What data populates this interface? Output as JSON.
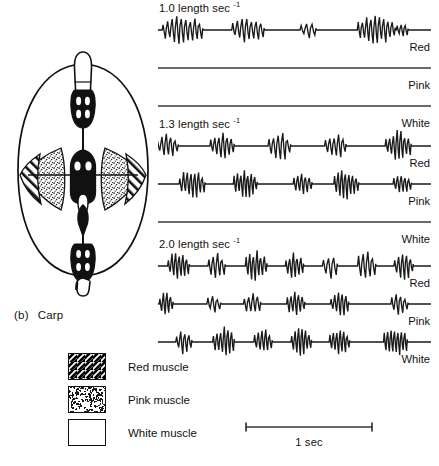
{
  "figure": {
    "panel_letter": "(b)",
    "species": "Carp"
  },
  "legend": {
    "items": [
      {
        "label": "Red muscle",
        "fill": "hatch"
      },
      {
        "label": "Pink muscle",
        "fill": "stipple"
      },
      {
        "label": "White muscle",
        "fill": "white"
      }
    ]
  },
  "scale": {
    "label": "1 sec"
  },
  "colors": {
    "ink": "#111111",
    "trace": "#1a1a1a",
    "background": "#ffffff"
  },
  "chart_data": {
    "type": "line",
    "xlabel": "time",
    "ylabel": "EMG amplitude",
    "x_scale_bar": "1 sec",
    "grid": false,
    "legend_position": "below-left",
    "channels": [
      "Red",
      "Pink",
      "White"
    ],
    "panels": [
      {
        "speed": "1.0",
        "speed_label": "1.0 length sec",
        "speed_exponent": "-1",
        "units": "length sec^-1",
        "traces": [
          {
            "channel": "Red",
            "active": true,
            "burst_count": 4,
            "bursts": [
              {
                "center": 0.09,
                "width": 0.075,
                "amplitude": 1.0,
                "spikes": 9
              },
              {
                "center": 0.33,
                "width": 0.06,
                "amplitude": 0.9,
                "spikes": 7
              },
              {
                "center": 0.55,
                "width": 0.03,
                "amplitude": 0.55,
                "spikes": 3
              },
              {
                "center": 0.8,
                "width": 0.07,
                "amplitude": 0.95,
                "spikes": 9
              },
              {
                "center": 0.895,
                "width": 0.022,
                "amplitude": 0.45,
                "spikes": 3
              }
            ]
          },
          {
            "channel": "Pink",
            "active": false,
            "burst_count": 0,
            "bursts": []
          },
          {
            "channel": "White",
            "active": false,
            "burst_count": 0,
            "bursts": []
          }
        ]
      },
      {
        "speed": "1.3",
        "speed_label": "1.3 length sec",
        "speed_exponent": "-1",
        "units": "length sec^-1",
        "traces": [
          {
            "channel": "Red",
            "active": true,
            "burst_count": 5,
            "bursts": [
              {
                "center": 0.035,
                "width": 0.04,
                "amplitude": 0.8,
                "spikes": 5
              },
              {
                "center": 0.235,
                "width": 0.045,
                "amplitude": 0.85,
                "spikes": 6
              },
              {
                "center": 0.445,
                "width": 0.042,
                "amplitude": 0.95,
                "spikes": 5
              },
              {
                "center": 0.65,
                "width": 0.04,
                "amplitude": 0.8,
                "spikes": 5
              },
              {
                "center": 0.88,
                "width": 0.048,
                "amplitude": 1.0,
                "spikes": 7
              }
            ]
          },
          {
            "channel": "Pink",
            "active": true,
            "burst_count": 5,
            "bursts": [
              {
                "center": 0.125,
                "width": 0.048,
                "amplitude": 0.95,
                "spikes": 7
              },
              {
                "center": 0.32,
                "width": 0.044,
                "amplitude": 0.9,
                "spikes": 7
              },
              {
                "center": 0.53,
                "width": 0.035,
                "amplitude": 0.65,
                "spikes": 5
              },
              {
                "center": 0.69,
                "width": 0.046,
                "amplitude": 1.0,
                "spikes": 7
              },
              {
                "center": 0.895,
                "width": 0.034,
                "amplitude": 0.65,
                "spikes": 5
              }
            ]
          },
          {
            "channel": "White",
            "active": false,
            "burst_count": 0,
            "bursts": []
          }
        ]
      },
      {
        "speed": "2.0",
        "speed_label": "2.0 length sec",
        "speed_exponent": "-1",
        "units": "length sec^-1",
        "traces": [
          {
            "channel": "Red",
            "active": true,
            "burst_count": 7,
            "bursts": [
              {
                "center": 0.075,
                "width": 0.04,
                "amplitude": 0.95,
                "spikes": 6
              },
              {
                "center": 0.215,
                "width": 0.032,
                "amplitude": 0.85,
                "spikes": 4
              },
              {
                "center": 0.36,
                "width": 0.04,
                "amplitude": 1.0,
                "spikes": 6
              },
              {
                "center": 0.5,
                "width": 0.034,
                "amplitude": 0.85,
                "spikes": 5
              },
              {
                "center": 0.63,
                "width": 0.028,
                "amplitude": 0.8,
                "spikes": 3
              },
              {
                "center": 0.765,
                "width": 0.034,
                "amplitude": 0.95,
                "spikes": 4
              },
              {
                "center": 0.9,
                "width": 0.036,
                "amplitude": 0.9,
                "spikes": 5
              }
            ]
          },
          {
            "channel": "Pink",
            "active": true,
            "burst_count": 6,
            "bursts": [
              {
                "center": 0.03,
                "width": 0.026,
                "amplitude": 0.75,
                "spikes": 4
              },
              {
                "center": 0.205,
                "width": 0.026,
                "amplitude": 0.6,
                "spikes": 3
              },
              {
                "center": 0.345,
                "width": 0.032,
                "amplitude": 0.7,
                "spikes": 4
              },
              {
                "center": 0.505,
                "width": 0.034,
                "amplitude": 0.85,
                "spikes": 5
              },
              {
                "center": 0.665,
                "width": 0.034,
                "amplitude": 0.8,
                "spikes": 5
              },
              {
                "center": 0.885,
                "width": 0.032,
                "amplitude": 0.75,
                "spikes": 4
              }
            ]
          },
          {
            "channel": "White",
            "active": true,
            "burst_count": 6,
            "bursts": [
              {
                "center": 0.095,
                "width": 0.03,
                "amplitude": 0.8,
                "spikes": 4
              },
              {
                "center": 0.24,
                "width": 0.04,
                "amplitude": 1.0,
                "spikes": 6
              },
              {
                "center": 0.385,
                "width": 0.034,
                "amplitude": 0.9,
                "spikes": 5
              },
              {
                "center": 0.525,
                "width": 0.038,
                "amplitude": 0.9,
                "spikes": 6
              },
              {
                "center": 0.665,
                "width": 0.038,
                "amplitude": 0.9,
                "spikes": 6
              },
              {
                "center": 0.87,
                "width": 0.044,
                "amplitude": 1.0,
                "spikes": 7
              }
            ]
          }
        ]
      }
    ]
  }
}
